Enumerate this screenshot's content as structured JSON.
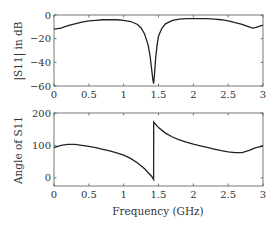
{
  "chart_data": [
    {
      "type": "line",
      "title": "",
      "xlabel": "",
      "ylabel": "|S11| in dB",
      "xlim": [
        0,
        3
      ],
      "ylim": [
        -60,
        0
      ],
      "xticks": [
        "0",
        "0.5",
        "1",
        "1.5",
        "2",
        "2.5",
        "3"
      ],
      "yticks": [
        "0",
        "-20",
        "-40",
        "-60"
      ],
      "grid": false,
      "series": [
        {
          "name": "|S11|",
          "x": [
            0,
            0.1,
            0.2,
            0.3,
            0.4,
            0.5,
            0.6,
            0.7,
            0.8,
            0.9,
            1.0,
            1.1,
            1.2,
            1.25,
            1.3,
            1.35,
            1.38,
            1.4,
            1.42,
            1.43,
            1.44,
            1.46,
            1.48,
            1.5,
            1.55,
            1.6,
            1.7,
            1.8,
            1.9,
            2.0,
            2.1,
            2.2,
            2.3,
            2.4,
            2.5,
            2.6,
            2.7,
            2.8,
            2.85,
            2.9,
            3.0
          ],
          "values": [
            -12,
            -11,
            -9,
            -7.5,
            -6,
            -5,
            -4.5,
            -4,
            -4,
            -4,
            -4.5,
            -5.5,
            -8,
            -11,
            -16,
            -25,
            -35,
            -45,
            -55,
            -58,
            -52,
            -36,
            -25,
            -18,
            -11,
            -7.5,
            -4.5,
            -3.5,
            -3,
            -3,
            -3,
            -3,
            -3.5,
            -4,
            -5,
            -6.5,
            -8,
            -10,
            -11,
            -10.5,
            -8.5
          ]
        }
      ]
    },
    {
      "type": "line",
      "title": "",
      "xlabel": "Frequency (GHz)",
      "ylabel": "Angle of S11",
      "xlim": [
        0,
        3
      ],
      "ylim": [
        -25,
        200
      ],
      "xticks": [
        "0",
        "0.5",
        "1",
        "1.5",
        "2",
        "2.5",
        "3"
      ],
      "yticks": [
        "200",
        "100",
        "0"
      ],
      "grid": false,
      "series": [
        {
          "name": "Angle",
          "x": [
            0,
            0.1,
            0.2,
            0.3,
            0.4,
            0.5,
            0.6,
            0.7,
            0.8,
            0.9,
            1.0,
            1.1,
            1.2,
            1.3,
            1.4,
            1.43,
            1.431,
            1.5,
            1.6,
            1.7,
            1.8,
            1.9,
            2.0,
            2.1,
            2.2,
            2.3,
            2.4,
            2.5,
            2.6,
            2.7,
            2.8,
            2.9,
            3.0
          ],
          "values": [
            93,
            100,
            103,
            103,
            100,
            97,
            93,
            88,
            83,
            77,
            70,
            60,
            46,
            28,
            5,
            -5,
            172,
            155,
            138,
            126,
            117,
            110,
            104,
            99,
            94,
            89,
            84,
            80,
            78,
            78,
            85,
            93,
            98
          ]
        }
      ]
    }
  ],
  "plots": {
    "top": {
      "ylabel": "|S11| in dB",
      "yticks": [
        "0",
        "-20",
        "-40",
        "-60"
      ],
      "xticks": [
        "0",
        "0.5",
        "1",
        "1.5",
        "2",
        "2.5",
        "3"
      ]
    },
    "bottom": {
      "ylabel": "Angle of S11",
      "yticks": [
        "200",
        "100",
        "0"
      ],
      "xticks": [
        "0",
        "0.5",
        "1",
        "1.5",
        "2",
        "2.5",
        "3"
      ],
      "xlabel": "Frequency (GHz)"
    }
  }
}
